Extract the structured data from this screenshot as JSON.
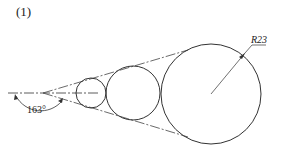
{
  "figure": {
    "label": "(1)"
  },
  "drawing": {
    "angle_label": "163°",
    "radius_label": "R23",
    "colors": {
      "stroke": "#333333",
      "background": "#ffffff"
    },
    "circles": [
      {
        "name": "small",
        "cx": 91,
        "cy": 93,
        "r": 15
      },
      {
        "name": "medium",
        "cx": 133,
        "cy": 93,
        "r": 27
      },
      {
        "name": "large",
        "cx": 211,
        "cy": 94,
        "r": 50
      }
    ]
  }
}
